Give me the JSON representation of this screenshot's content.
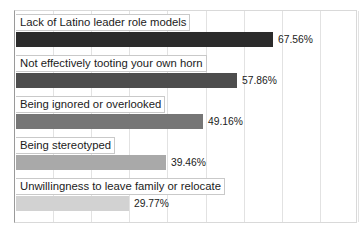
{
  "chart_data": {
    "type": "bar",
    "orientation": "horizontal",
    "title": "",
    "subtitle": "",
    "xlabel": "",
    "ylabel": "",
    "xlim": [
      0,
      90
    ],
    "grid": true,
    "gridline_values": [
      10,
      20,
      30,
      40,
      50,
      60,
      70,
      80,
      90
    ],
    "legend": false,
    "value_label_suffix": "%",
    "categories": [
      "Lack of Latino leader role models",
      "Not effectively tooting your own horn",
      "Being ignored or overlooked",
      "Being stereotyped",
      "Unwillingness to leave family or relocate"
    ],
    "values": [
      67.56,
      57.86,
      49.16,
      39.46,
      29.77
    ],
    "value_labels": [
      "67.56%",
      "57.86%",
      "49.16%",
      "39.46%",
      "29.77%"
    ],
    "bar_colors": [
      "#2b2b2b",
      "#4d4d4d",
      "#767676",
      "#a9a9a9",
      "#d2d2d2"
    ],
    "bars": [
      {
        "label": "Lack of Latino leader role models",
        "value": 67.56,
        "value_label": "67.56%",
        "color": "#2b2b2b"
      },
      {
        "label": "Not effectively tooting your own horn",
        "value": 57.86,
        "value_label": "57.86%",
        "color": "#4d4d4d"
      },
      {
        "label": "Being ignored or overlooked",
        "value": 49.16,
        "value_label": "49.16%",
        "color": "#767676"
      },
      {
        "label": "Being stereotyped",
        "value": 39.46,
        "value_label": "39.46%",
        "color": "#a9a9a9"
      },
      {
        "label": "Unwillingness to leave family or relocate",
        "value": 29.77,
        "value_label": "29.77%",
        "color": "#d2d2d2"
      }
    ]
  },
  "style": {
    "plot_background": "#ffffff",
    "gridline_color": "#e2e2e2",
    "axis_color": "#9a9a9a",
    "border_color": "#d9d9d9",
    "text_color": "#1b1b1b"
  }
}
